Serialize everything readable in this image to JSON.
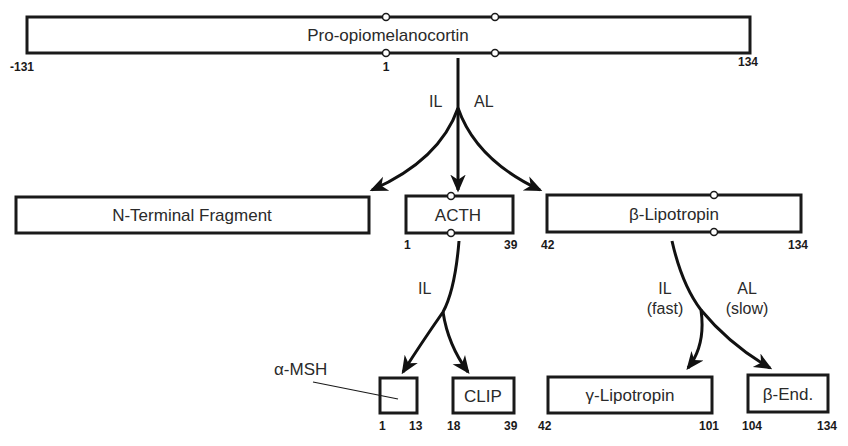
{
  "diagram": {
    "precursor": {
      "label": "Pro-opiomelanocortin",
      "start": "-131",
      "mid": "1",
      "end": "134"
    },
    "level1": {
      "labels": {
        "left": "IL",
        "right": "AL"
      },
      "n_terminal": {
        "label": "N-Terminal Fragment"
      },
      "acth": {
        "label": "ACTH",
        "start": "1",
        "end": "39"
      },
      "beta_lpt": {
        "label": "β-Lipotropin",
        "start": "42",
        "end": "134"
      }
    },
    "level2": {
      "acth_branch": {
        "label": "IL"
      },
      "lpt_branch": {
        "left": "IL",
        "left_sub": "(fast)",
        "right": "AL",
        "right_sub": "(slow)"
      },
      "alpha_msh": {
        "label": "α-MSH",
        "start": "1",
        "end": "13"
      },
      "clip": {
        "label": "CLIP",
        "start": "18",
        "end": "39"
      },
      "gamma_lpt": {
        "label": "γ-Lipotropin",
        "start": "42",
        "end": "101"
      },
      "beta_end": {
        "label": "β-End.",
        "start": "104",
        "end": "134"
      }
    }
  }
}
